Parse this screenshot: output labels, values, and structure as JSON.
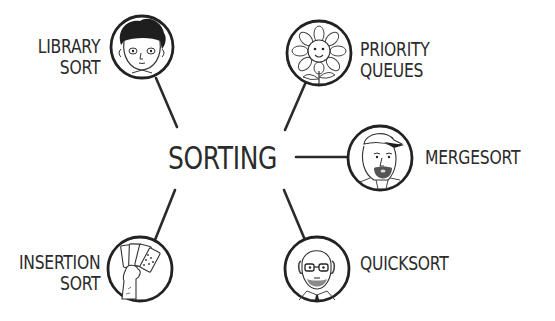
{
  "diagram": {
    "type": "mind-map",
    "center": {
      "label": "SORTING"
    },
    "colors": {
      "line": "#2b2b2b",
      "text": "#2b2b2b",
      "background": "#ffffff"
    },
    "nodes": [
      {
        "id": "library-sort",
        "lines": [
          "LIBRARY",
          "SORT"
        ],
        "icon": "boy-portrait-icon",
        "position": "top-left"
      },
      {
        "id": "priority-queues",
        "lines": [
          "PRIORITY",
          "QUEUES"
        ],
        "icon": "sunflower-icon",
        "position": "top-right"
      },
      {
        "id": "mergesort",
        "lines": [
          "MERGESORT"
        ],
        "icon": "man-with-cap-portrait-icon",
        "position": "right"
      },
      {
        "id": "insertion-sort",
        "lines": [
          "INSERTION",
          "SORT"
        ],
        "icon": "hand-holding-cards-icon",
        "position": "bottom-left"
      },
      {
        "id": "quicksort",
        "lines": [
          "QUICKSORT"
        ],
        "icon": "bald-man-glasses-portrait-icon",
        "position": "bottom-right"
      }
    ]
  }
}
